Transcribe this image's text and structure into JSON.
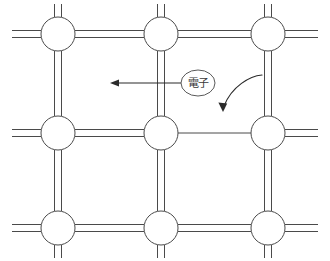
{
  "figure": {
    "type": "semiconductor-crystal-lattice-diagram",
    "background_color": "#ffffff",
    "line_color": "#4a4a4a",
    "arrow_color": "#2b2b2b",
    "width": 330,
    "height": 261
  },
  "labels": {
    "electron": "電子"
  },
  "lattice": {
    "atom_radius": 17,
    "bond_gap": 7,
    "columns_x": [
      58,
      161,
      268
    ],
    "rows_y": [
      34,
      133,
      228
    ],
    "edge_stub_left": 12,
    "edge_stub_right": 318,
    "atoms": [
      {
        "name": "atom-top-left",
        "cx": 58,
        "cy": 34
      },
      {
        "name": "atom-top-center",
        "cx": 161,
        "cy": 34
      },
      {
        "name": "atom-top-right",
        "cx": 268,
        "cy": 34
      },
      {
        "name": "atom-middle-left",
        "cx": 58,
        "cy": 133
      },
      {
        "name": "atom-middle-center",
        "cx": 161,
        "cy": 133
      },
      {
        "name": "atom-middle-right",
        "cx": 268,
        "cy": 133
      },
      {
        "name": "atom-bottom-left",
        "cx": 58,
        "cy": 228
      },
      {
        "name": "atom-bottom-center",
        "cx": 161,
        "cy": 228
      },
      {
        "name": "atom-bottom-right",
        "cx": 268,
        "cy": 228
      }
    ],
    "bonds": [
      {
        "name": "bond-top-left-stub",
        "orientation": "h",
        "from": 12,
        "to": 41,
        "at": 34,
        "kind": "double"
      },
      {
        "name": "bond-top-left-to-top-center",
        "orientation": "h",
        "from": 75,
        "to": 144,
        "at": 34,
        "kind": "double"
      },
      {
        "name": "bond-top-center-to-top-right",
        "orientation": "h",
        "from": 178,
        "to": 251,
        "at": 34,
        "kind": "double"
      },
      {
        "name": "bond-top-right-stub",
        "orientation": "h",
        "from": 285,
        "to": 318,
        "at": 34,
        "kind": "double"
      },
      {
        "name": "bond-middle-left-stub",
        "orientation": "h",
        "from": 12,
        "to": 41,
        "at": 133,
        "kind": "double"
      },
      {
        "name": "bond-middle-left-to-middle-center",
        "orientation": "h",
        "from": 75,
        "to": 144,
        "at": 133,
        "kind": "double"
      },
      {
        "name": "bond-middle-center-to-middle-right-broken",
        "orientation": "h",
        "from": 178,
        "to": 251,
        "at": 133,
        "kind": "single"
      },
      {
        "name": "bond-middle-right-stub",
        "orientation": "h",
        "from": 285,
        "to": 318,
        "at": 133,
        "kind": "double"
      },
      {
        "name": "bond-bottom-left-stub",
        "orientation": "h",
        "from": 12,
        "to": 41,
        "at": 228,
        "kind": "double"
      },
      {
        "name": "bond-bottom-left-to-bottom-center",
        "orientation": "h",
        "from": 75,
        "to": 144,
        "at": 228,
        "kind": "double"
      },
      {
        "name": "bond-bottom-center-to-bottom-right",
        "orientation": "h",
        "from": 178,
        "to": 251,
        "at": 228,
        "kind": "double"
      },
      {
        "name": "bond-bottom-right-stub",
        "orientation": "h",
        "from": 285,
        "to": 318,
        "at": 228,
        "kind": "double"
      },
      {
        "name": "bond-top-left-to-middle-left",
        "orientation": "v",
        "from": 51,
        "to": 116,
        "at": 58,
        "kind": "double"
      },
      {
        "name": "bond-top-center-to-middle-center",
        "orientation": "v",
        "from": 51,
        "to": 116,
        "at": 161,
        "kind": "double"
      },
      {
        "name": "bond-top-right-to-middle-right",
        "orientation": "v",
        "from": 51,
        "to": 116,
        "at": 268,
        "kind": "double"
      },
      {
        "name": "bond-middle-left-to-bottom-left",
        "orientation": "v",
        "from": 150,
        "to": 211,
        "at": 58,
        "kind": "double"
      },
      {
        "name": "bond-middle-center-to-bottom-center",
        "orientation": "v",
        "from": 150,
        "to": 211,
        "at": 161,
        "kind": "double"
      },
      {
        "name": "bond-middle-right-to-bottom-right",
        "orientation": "v",
        "from": 150,
        "to": 211,
        "at": 268,
        "kind": "double"
      },
      {
        "name": "bond-top-left-top-stub",
        "orientation": "v",
        "from": 4,
        "to": 17,
        "at": 58,
        "kind": "double"
      },
      {
        "name": "bond-top-center-top-stub",
        "orientation": "v",
        "from": 4,
        "to": 17,
        "at": 161,
        "kind": "double"
      },
      {
        "name": "bond-top-right-top-stub",
        "orientation": "v",
        "from": 4,
        "to": 17,
        "at": 268,
        "kind": "double"
      },
      {
        "name": "bond-bottom-left-bottom-stub",
        "orientation": "v",
        "from": 245,
        "to": 258,
        "at": 58,
        "kind": "double"
      },
      {
        "name": "bond-bottom-center-bottom-stub",
        "orientation": "v",
        "from": 245,
        "to": 258,
        "at": 161,
        "kind": "double"
      },
      {
        "name": "bond-bottom-right-bottom-stub",
        "orientation": "v",
        "from": 245,
        "to": 258,
        "at": 268,
        "kind": "double"
      }
    ]
  },
  "annotations": {
    "electron_marker": {
      "name": "electron-label-oval",
      "cx": 198,
      "cy": 83,
      "rx": 17,
      "ry": 13
    },
    "electron_arrow": {
      "name": "electron-motion-arrow",
      "direction": "left",
      "x_start": 181,
      "x_end": 110,
      "y": 83
    },
    "hole_arrow": {
      "name": "hole-motion-arrow",
      "direction": "down-left-curve",
      "path": "M 262 75 C 250 76, 232 86, 224 106",
      "tip_x": 223,
      "tip_y": 112
    }
  }
}
